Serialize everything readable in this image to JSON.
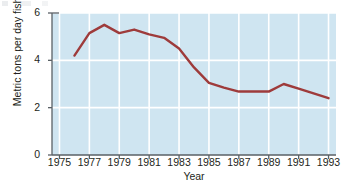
{
  "chart_data": {
    "type": "line",
    "title": "",
    "xlabel": "Year",
    "ylabel": "Metric tons per day fished",
    "xlim": [
      1974.5,
      1993.5
    ],
    "ylim": [
      0,
      6
    ],
    "yticks": [
      0,
      2,
      4,
      6
    ],
    "ytick_labels": [
      "0",
      "2",
      "4",
      "6"
    ],
    "xticks": [
      1975,
      1977,
      1979,
      1981,
      1983,
      1985,
      1987,
      1989,
      1991,
      1993
    ],
    "xtick_labels": [
      "1975",
      "1977",
      "1979",
      "1981",
      "1983",
      "1985",
      "1987",
      "1989",
      "1991",
      "1993"
    ],
    "grid": true,
    "legend": "none",
    "x": [
      1976,
      1977,
      1978,
      1979,
      1980,
      1981,
      1982,
      1983,
      1984,
      1985,
      1986,
      1987,
      1988,
      1989,
      1990,
      1991,
      1992,
      1993
    ],
    "values": [
      4.2,
      5.15,
      5.5,
      5.15,
      5.3,
      5.1,
      4.95,
      4.5,
      3.7,
      3.05,
      2.85,
      2.68,
      2.68,
      2.68,
      3.0,
      2.8,
      2.6,
      2.4
    ],
    "series": [
      {
        "name": "Metric tons per day fished",
        "values": [
          4.2,
          5.15,
          5.5,
          5.15,
          5.3,
          5.1,
          4.95,
          4.5,
          3.7,
          3.05,
          2.85,
          2.68,
          2.68,
          2.68,
          3.0,
          2.8,
          2.6,
          2.4
        ]
      }
    ],
    "colors": {
      "line": "#9e3b3b",
      "plot_background": "#cfe5f1",
      "gridline": "#ffffff",
      "axis": "#5a6166",
      "text": "#231f20",
      "figure_background": "#ffffff"
    }
  }
}
